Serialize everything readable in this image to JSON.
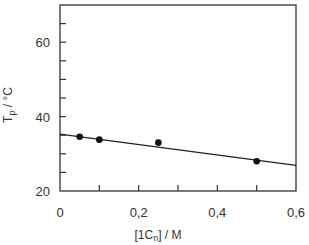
{
  "chart_data": {
    "type": "scatter",
    "title": "",
    "xlabel": "[1Cn] / M",
    "ylabel": "Tp / °C",
    "ylabel_main": "T",
    "ylabel_sub": "p",
    "ylabel_rest": " / °C",
    "xlabel_main": "[1C",
    "xlabel_sub": "n",
    "xlabel_rest": "] / M",
    "xlim": [
      0,
      0.6
    ],
    "ylim": [
      20,
      70
    ],
    "x_ticks": [
      0,
      0.1,
      0.2,
      0.3,
      0.4,
      0.5,
      0.6
    ],
    "x_tick_labels": [
      "0",
      "",
      "0,2",
      "",
      "0,4",
      "",
      "0,6"
    ],
    "y_ticks": [
      20,
      25,
      30,
      35,
      40,
      45,
      50,
      55,
      60,
      65
    ],
    "y_tick_labels": [
      "20",
      "",
      "",
      "",
      "40",
      "",
      "",
      "",
      "60",
      ""
    ],
    "grid": false,
    "legend": null,
    "series": [
      {
        "name": "measured",
        "marker": "filled-circle",
        "x": [
          0.05,
          0.1,
          0.25,
          0.5
        ],
        "y": [
          34.6,
          33.8,
          33.0,
          28.0
        ]
      }
    ],
    "fit_line": {
      "name": "linear fit",
      "x": [
        0,
        0.6
      ],
      "y": [
        35.3,
        26.9
      ]
    }
  }
}
